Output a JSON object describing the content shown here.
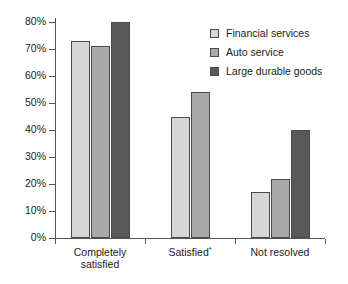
{
  "chart_data": {
    "type": "bar",
    "title": "",
    "xlabel": "",
    "ylabel": "",
    "ylim": [
      0,
      80
    ],
    "grid": false,
    "legend_position": "top-right",
    "categories": [
      "Completely satisfied",
      "Satisfied*",
      "Not resolved"
    ],
    "category_lines": [
      [
        "Completely",
        "satisfied"
      ],
      [
        "Satisfied*"
      ],
      [
        "Not resolved"
      ]
    ],
    "ytick_labels": [
      "0%",
      "10%",
      "20%",
      "30%",
      "40%",
      "50%",
      "60%",
      "70%",
      "80%"
    ],
    "ytick_values": [
      0,
      10,
      20,
      30,
      40,
      50,
      60,
      70,
      80
    ],
    "series": [
      {
        "name": "Financial services",
        "color": "#d6d6d6",
        "values": [
          73,
          45,
          17
        ]
      },
      {
        "name": "Auto service",
        "color": "#a9a9a9",
        "values": [
          71,
          54,
          22
        ]
      },
      {
        "name": "Large durable goods",
        "color": "#595959",
        "values": [
          80,
          null,
          40
        ]
      }
    ],
    "footnote_marker": "*"
  },
  "legend": {
    "items": [
      {
        "label": "Financial services",
        "color": "#d6d6d6"
      },
      {
        "label": "Auto service",
        "color": "#a9a9a9"
      },
      {
        "label": "Large durable goods",
        "color": "#595959"
      }
    ]
  },
  "colors": {
    "axis": "#555555",
    "bar_border": "#4a4a4a",
    "text": "#1a1a1a",
    "background": "#ffffff"
  }
}
